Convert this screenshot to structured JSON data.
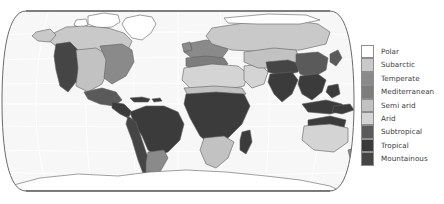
{
  "map": {
    "title": "World Climate Zones Map",
    "projection": "robinson",
    "ocean_color": "#f7f7f7",
    "graticule_color": "#ffffff",
    "outline_color": "#555555",
    "frame_color": "#4a4a4a",
    "background_color": "#ffffff"
  },
  "legend": {
    "name": "climate-zone-legend",
    "items": [
      {
        "label": "Polar",
        "color": "#ffffff"
      },
      {
        "label": "Subarctic",
        "color": "#c9c9c9"
      },
      {
        "label": "Temperate",
        "color": "#8a8a8a"
      },
      {
        "label": "Mediterranean",
        "color": "#7d7d7d"
      },
      {
        "label": "Semi arid",
        "color": "#c2c2c2"
      },
      {
        "label": "Arid",
        "color": "#d4d4d4"
      },
      {
        "label": "Subtropical",
        "color": "#5a5a5a"
      },
      {
        "label": "Tropical",
        "color": "#3b3b3b"
      },
      {
        "label": "Mountainous",
        "color": "#454545"
      }
    ]
  },
  "regions": [
    {
      "name": "greenland",
      "zone": "Polar"
    },
    {
      "name": "arctic-canada",
      "zone": "Polar"
    },
    {
      "name": "northern-canada",
      "zone": "Subarctic"
    },
    {
      "name": "siberia",
      "zone": "Subarctic"
    },
    {
      "name": "western-north-america",
      "zone": "Mountainous"
    },
    {
      "name": "central-usa",
      "zone": "Semi arid"
    },
    {
      "name": "eastern-usa",
      "zone": "Temperate"
    },
    {
      "name": "mexico",
      "zone": "Subtropical"
    },
    {
      "name": "central-america",
      "zone": "Tropical"
    },
    {
      "name": "amazon-basin",
      "zone": "Tropical"
    },
    {
      "name": "andes",
      "zone": "Mountainous"
    },
    {
      "name": "southern-south-america",
      "zone": "Temperate"
    },
    {
      "name": "europe",
      "zone": "Temperate"
    },
    {
      "name": "mediterranean-basin",
      "zone": "Mediterranean"
    },
    {
      "name": "sahara",
      "zone": "Arid"
    },
    {
      "name": "sahel",
      "zone": "Semi arid"
    },
    {
      "name": "central-africa",
      "zone": "Tropical"
    },
    {
      "name": "southern-africa",
      "zone": "Semi arid"
    },
    {
      "name": "arabia",
      "zone": "Arid"
    },
    {
      "name": "central-asia",
      "zone": "Semi arid"
    },
    {
      "name": "himalaya-tibet",
      "zone": "Mountainous"
    },
    {
      "name": "india",
      "zone": "Tropical"
    },
    {
      "name": "southeast-asia",
      "zone": "Tropical"
    },
    {
      "name": "east-china",
      "zone": "Subtropical"
    },
    {
      "name": "indonesia",
      "zone": "Tropical"
    },
    {
      "name": "australia-interior",
      "zone": "Arid"
    },
    {
      "name": "northern-australia",
      "zone": "Tropical"
    },
    {
      "name": "antarctica",
      "zone": "Polar"
    }
  ]
}
